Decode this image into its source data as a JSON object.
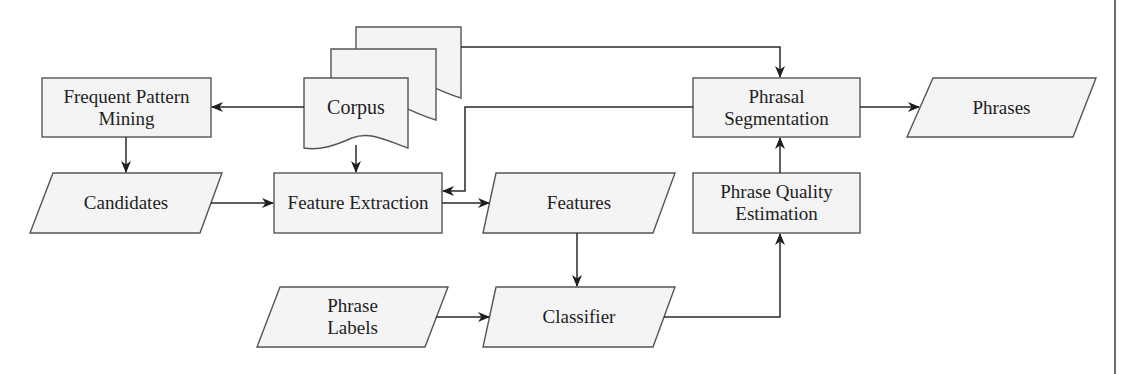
{
  "diagram": {
    "nodes": {
      "frequent_pattern_mining": {
        "line1": "Frequent Pattern",
        "line2": "Mining",
        "shape": "process"
      },
      "corpus": {
        "label": "Corpus",
        "shape": "multi-document"
      },
      "candidates": {
        "label": "Candidates",
        "shape": "data"
      },
      "feature_extraction": {
        "label": "Feature Extraction",
        "shape": "process"
      },
      "features": {
        "label": "Features",
        "shape": "data"
      },
      "phrase_labels": {
        "line1": "Phrase",
        "line2": "Labels",
        "shape": "data"
      },
      "classifier": {
        "label": "Classifier",
        "shape": "data"
      },
      "phrase_quality_estimation": {
        "line1": "Phrase Quality",
        "line2": "Estimation",
        "shape": "process"
      },
      "phrasal_segmentation": {
        "line1": "Phrasal",
        "line2": "Segmentation",
        "shape": "process"
      },
      "phrases": {
        "label": "Phrases",
        "shape": "data"
      }
    },
    "edges": [
      {
        "from": "Corpus",
        "to": "Frequent Pattern Mining"
      },
      {
        "from": "Frequent Pattern Mining",
        "to": "Candidates"
      },
      {
        "from": "Corpus",
        "to": "Feature Extraction"
      },
      {
        "from": "Corpus",
        "to": "Phrasal Segmentation"
      },
      {
        "from": "Candidates",
        "to": "Feature Extraction"
      },
      {
        "from": "Phrasal Segmentation",
        "to": "Feature Extraction"
      },
      {
        "from": "Feature Extraction",
        "to": "Features"
      },
      {
        "from": "Features",
        "to": "Classifier"
      },
      {
        "from": "Phrase Labels",
        "to": "Classifier"
      },
      {
        "from": "Classifier",
        "to": "Phrase Quality Estimation"
      },
      {
        "from": "Phrase Quality Estimation",
        "to": "Phrasal Segmentation"
      },
      {
        "from": "Phrasal Segmentation",
        "to": "Phrases"
      }
    ]
  }
}
